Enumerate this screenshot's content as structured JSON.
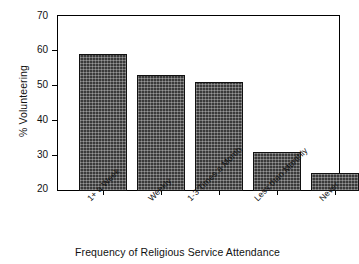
{
  "chart_data": {
    "type": "bar",
    "title": "",
    "xlabel": "Frequency of Religious Service Attendance",
    "ylabel": "% Volunteering",
    "categories": [
      "1+ a Week",
      "Weekly",
      "1-3 Times a Month",
      "Less than Monthly",
      "Never"
    ],
    "values": [
      59,
      53,
      51,
      31,
      25
    ],
    "ylim": [
      20,
      70
    ],
    "yticks": [
      20,
      30,
      40,
      50,
      60,
      70
    ],
    "ytick_labels": [
      "20",
      "30",
      "40",
      "50",
      "60",
      "70"
    ],
    "grid": false,
    "legend": false,
    "legend_position": "none",
    "bar_color": "#3a3a3a",
    "bar_edge_color": "#111111",
    "axis_color": "#000000",
    "background_color": "#ffffff"
  }
}
